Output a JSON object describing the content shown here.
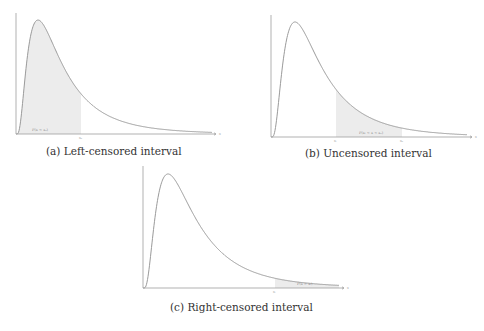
{
  "figure": {
    "panels": [
      {
        "id": "a",
        "caption": "(a) Left-censored interval",
        "area_label": "P(x < xᵤ)",
        "tick_labels": [
          "xᵤ"
        ],
        "axis_label_x": "x"
      },
      {
        "id": "b",
        "caption": "(b) Uncensored interval",
        "area_label": "P(xₗ < x < xᵤ)",
        "tick_labels": [
          "xₗ",
          "xᵤ"
        ],
        "axis_label_x": "x"
      },
      {
        "id": "c",
        "caption": "(c) Right-censored interval",
        "area_label": "P(x > xₗ)",
        "tick_labels": [
          "xₗ"
        ],
        "axis_label_x": "x"
      }
    ]
  },
  "chart_data": [
    {
      "type": "area",
      "title": "(a) Left-censored interval",
      "xlabel": "x",
      "ylabel": "",
      "curve": "right-skewed probability density (log-normal-like)",
      "shaded_region": {
        "from": "0",
        "to": "x_u"
      },
      "shaded_label": "P(x < x_u)",
      "ticks": [
        "x_u"
      ],
      "grid": false,
      "box": {
        "x0": 16,
        "y_axis_top": 13,
        "y_base": 134,
        "x_end": 216,
        "peak_x": 38,
        "peak_y": 20,
        "curve_end_x": 212,
        "curve_end_y": 123,
        "shade_from_x": 16,
        "shade_to_x": 81
      }
    },
    {
      "type": "area",
      "title": "(b) Uncensored interval",
      "xlabel": "x",
      "ylabel": "",
      "curve": "right-skewed probability density (log-normal-like)",
      "shaded_region": {
        "from": "x_l",
        "to": "x_u"
      },
      "shaded_label": "P(x_l < x < x_u)",
      "ticks": [
        "x_l",
        "x_u"
      ],
      "grid": false,
      "box": {
        "x0": 271,
        "y_axis_top": 15,
        "y_base": 137,
        "x_end": 472,
        "peak_x": 295,
        "peak_y": 22,
        "curve_end_x": 467,
        "curve_end_y": 125,
        "shade_from_x": 336,
        "shade_to_x": 402
      }
    },
    {
      "type": "area",
      "title": "(c) Right-censored interval",
      "xlabel": "x",
      "ylabel": "",
      "curve": "right-skewed probability density (log-normal-like)",
      "shaded_region": {
        "from": "x_l",
        "to": "infinity"
      },
      "shaded_label": "P(x > x_l)",
      "ticks": [
        "x_l"
      ],
      "grid": false,
      "box": {
        "x0": 143,
        "y_axis_top": 166,
        "y_base": 288,
        "x_end": 344,
        "peak_x": 168,
        "peak_y": 174,
        "curve_end_x": 339,
        "curve_end_y": 276,
        "shade_from_x": 275,
        "shade_to_x": 339
      }
    }
  ]
}
